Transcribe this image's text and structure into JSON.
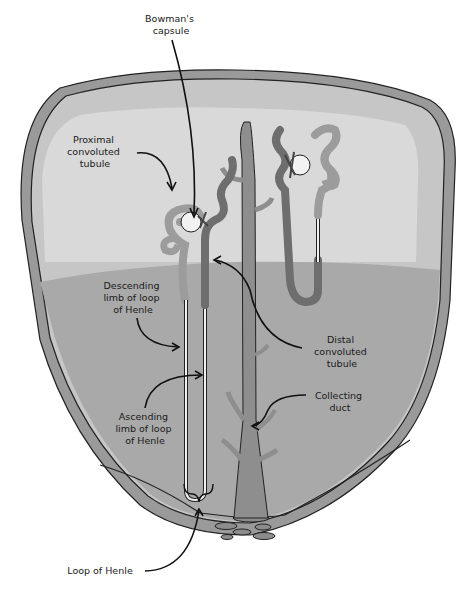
{
  "diagram": {
    "colors": {
      "background": "#ffffff",
      "capsule_wall": "#9a9a9a",
      "cortex_outer": "#c8c8c8",
      "cortex_inner": "#d8d8d8",
      "medulla": "#a8a8a8",
      "tubule_light": "#9c9c9c",
      "tubule_dark": "#6e6e6e",
      "collecting_duct": "#8e8e8e",
      "glomerulus": "#f2f2f2",
      "outline": "#222222"
    },
    "labels": {
      "bowmans_capsule": [
        "Bowman's",
        "capsule"
      ],
      "proximal_convoluted_tubule": [
        "Proximal",
        "convoluted",
        "tubule"
      ],
      "descending_limb": [
        "Descending",
        "limb of loop",
        "of Henle"
      ],
      "distal_convoluted_tubule": [
        "Distal",
        "convoluted",
        "tubule"
      ],
      "collecting_duct": [
        "Collecting",
        "duct"
      ],
      "ascending_limb": [
        "Ascending",
        "limb of loop",
        "of Henle"
      ],
      "loop_of_henle": "Loop of Henle"
    }
  }
}
